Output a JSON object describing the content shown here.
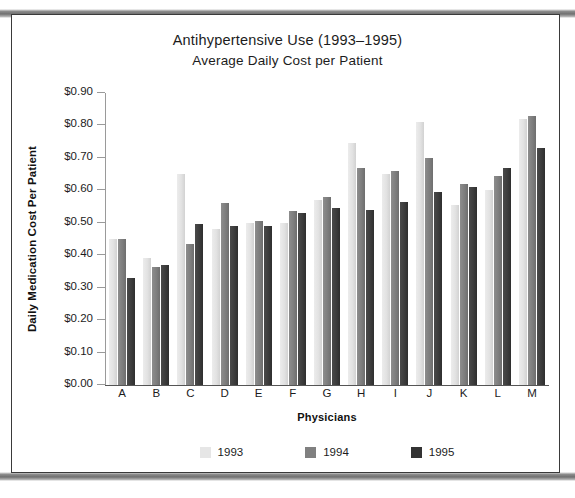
{
  "chart_data": {
    "type": "bar",
    "title": "Antihypertensive Use (1993–1995)",
    "subtitle": "Average Daily Cost per Patient",
    "xlabel": "Physicians",
    "ylabel": "Daily Medication Cost Per Patient",
    "categories": [
      "A",
      "B",
      "C",
      "D",
      "E",
      "F",
      "G",
      "H",
      "I",
      "J",
      "K",
      "L",
      "M"
    ],
    "ylim": [
      0.0,
      0.9
    ],
    "ytick_labels": [
      "$0.90",
      "$0.80",
      "$0.70",
      "$0.60",
      "$0.50",
      "$0.40",
      "$0.30",
      "$0.20",
      "$0.10",
      "$0.00"
    ],
    "ytick_values": [
      0.9,
      0.8,
      0.7,
      0.6,
      0.5,
      0.4,
      0.3,
      0.2,
      0.1,
      0.0
    ],
    "grid": false,
    "legend_position": "bottom",
    "series": [
      {
        "name": "1993",
        "color": "#e6e6e6",
        "values": [
          0.45,
          0.39,
          0.65,
          0.48,
          0.5,
          0.5,
          0.57,
          0.745,
          0.65,
          0.81,
          0.555,
          0.6,
          0.82
        ]
      },
      {
        "name": "1994",
        "color": "#808080",
        "values": [
          0.45,
          0.365,
          0.435,
          0.56,
          0.505,
          0.535,
          0.58,
          0.67,
          0.66,
          0.7,
          0.62,
          0.645,
          0.83
        ]
      },
      {
        "name": "1995",
        "color": "#333333",
        "values": [
          0.33,
          0.37,
          0.495,
          0.49,
          0.49,
          0.53,
          0.545,
          0.54,
          0.565,
          0.595,
          0.61,
          0.67,
          0.73
        ]
      }
    ]
  },
  "legend": {
    "items": [
      {
        "label": "1993",
        "key": "y1993"
      },
      {
        "label": "1994",
        "key": "y1994"
      },
      {
        "label": "1995",
        "key": "y1995"
      }
    ]
  }
}
